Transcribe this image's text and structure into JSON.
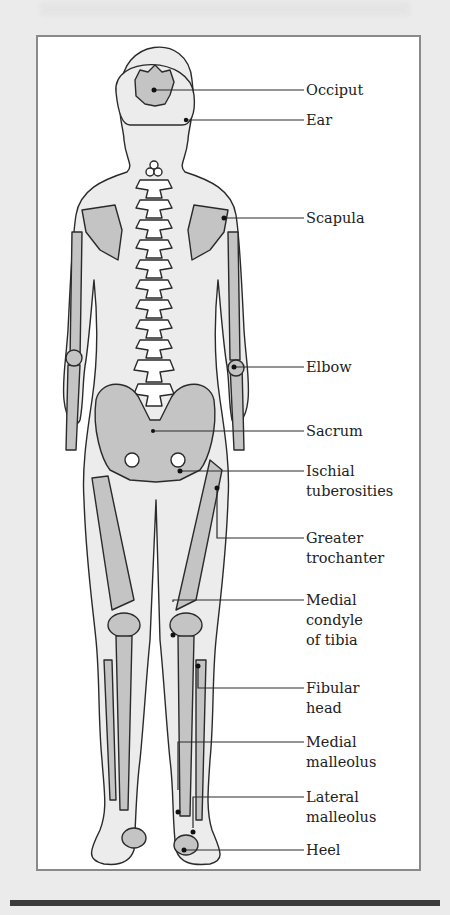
{
  "colors": {
    "page_bg": "#ebebeb",
    "frame_border": "#8a8a8a",
    "skin": "#ececec",
    "bone": "#c4c4c4",
    "outline": "#2a2a2a",
    "bar": "#3a3a3a"
  },
  "labels": [
    {
      "id": "occiput",
      "text": "Occiput",
      "y": 104
    },
    {
      "id": "ear",
      "text": "Ear",
      "y": 134
    },
    {
      "id": "scapula",
      "text": "Scapula",
      "y": 206
    },
    {
      "id": "elbow",
      "text": "Elbow",
      "y": 357
    },
    {
      "id": "sacrum",
      "text": "Sacrum",
      "y": 424
    },
    {
      "id": "ischial",
      "text": "Ischial\ntuberosities",
      "y": 460
    },
    {
      "id": "greater-trochanter",
      "text": "Greater\ntrochanter",
      "y": 528
    },
    {
      "id": "medial-condyle",
      "text": "Medial\ncondyle\nof tibia",
      "y": 592
    },
    {
      "id": "fibular-head",
      "text": "Fibular\nhead",
      "y": 680
    },
    {
      "id": "medial-malleolus",
      "text": "Medial\nmalleolus",
      "y": 735
    },
    {
      "id": "lateral-malleolus",
      "text": "Lateral\nmalleolus",
      "y": 788
    },
    {
      "id": "heel",
      "text": "Heel",
      "y": 843
    }
  ]
}
